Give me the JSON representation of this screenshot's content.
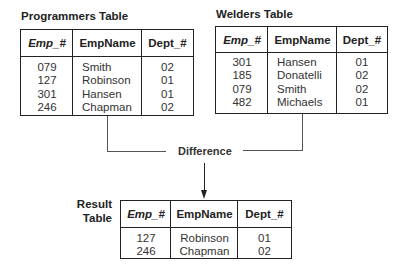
{
  "tables": {
    "programmers": {
      "title": "Programmers Table",
      "headers": [
        "Emp_#",
        "EmpName",
        "Dept_#"
      ],
      "emp": [
        "079",
        "127",
        "301",
        "246"
      ],
      "name": [
        "Smith",
        "Robinson",
        "Hansen",
        "Chapman"
      ],
      "dept": [
        "02",
        "01",
        "01",
        "02"
      ]
    },
    "welders": {
      "title": "Welders Table",
      "headers": [
        "Emp_#",
        "EmpName",
        "Dept_#"
      ],
      "emp": [
        "301",
        "185",
        "079",
        "482"
      ],
      "name": [
        "Hansen",
        "Donatelli",
        "Smith",
        "Michaels"
      ],
      "dept": [
        "01",
        "02",
        "02",
        "01"
      ]
    },
    "result": {
      "title_line1": "Result",
      "title_line2": "Table",
      "headers": [
        "Emp_#",
        "EmpName",
        "Dept_#"
      ],
      "emp": [
        "127",
        "246"
      ],
      "name": [
        "Robinson",
        "Chapman"
      ],
      "dept": [
        "01",
        "02"
      ]
    }
  },
  "operation": {
    "label": "Difference"
  },
  "colors": {
    "line": "#222222",
    "connector": "#555555",
    "background": "#ffffff"
  }
}
